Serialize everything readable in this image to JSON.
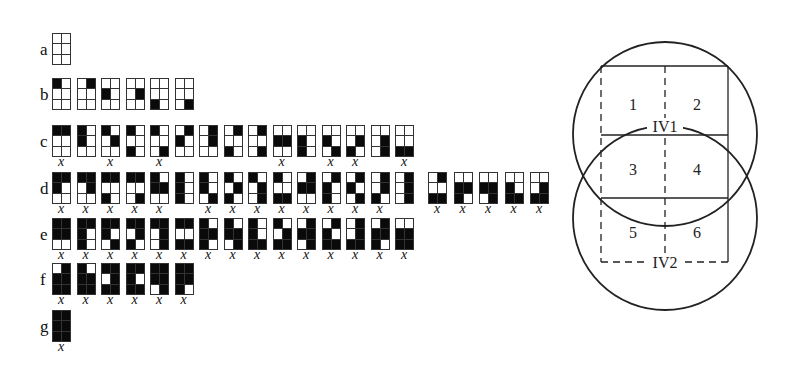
{
  "rows": [
    {
      "label": "a",
      "top": 33,
      "grids": [
        {
          "on": [],
          "x": false
        }
      ]
    },
    {
      "label": "b",
      "top": 78,
      "grids": [
        {
          "on": [
            1
          ],
          "x": false
        },
        {
          "on": [
            2
          ],
          "x": false
        },
        {
          "on": [
            3
          ],
          "x": false
        },
        {
          "on": [
            4
          ],
          "x": false
        },
        {
          "on": [
            5
          ],
          "x": false
        },
        {
          "on": [
            6
          ],
          "x": false
        }
      ]
    },
    {
      "label": "c",
      "top": 125,
      "grids": [
        {
          "on": [
            1,
            2
          ],
          "x": true
        },
        {
          "on": [
            1,
            3
          ],
          "x": false
        },
        {
          "on": [
            1,
            4
          ],
          "x": true
        },
        {
          "on": [
            1,
            5
          ],
          "x": false
        },
        {
          "on": [
            1,
            6
          ],
          "x": true
        },
        {
          "on": [
            2,
            3
          ],
          "x": false
        },
        {
          "on": [
            2,
            4
          ],
          "x": false
        },
        {
          "on": [
            2,
            5
          ],
          "x": false
        },
        {
          "on": [
            2,
            6
          ],
          "x": false
        },
        {
          "on": [
            3,
            4
          ],
          "x": true
        },
        {
          "on": [
            3,
            5
          ],
          "x": false
        },
        {
          "on": [
            3,
            6
          ],
          "x": true
        },
        {
          "on": [
            4,
            5
          ],
          "x": true
        },
        {
          "on": [
            4,
            6
          ],
          "x": false
        },
        {
          "on": [
            5,
            6
          ],
          "x": true
        }
      ]
    },
    {
      "label": "d",
      "top": 172,
      "grids": [
        {
          "on": [
            1,
            2,
            3
          ],
          "x": true
        },
        {
          "on": [
            1,
            2,
            4
          ],
          "x": true
        },
        {
          "on": [
            1,
            2,
            5
          ],
          "x": true
        },
        {
          "on": [
            1,
            2,
            6
          ],
          "x": true
        },
        {
          "on": [
            1,
            3,
            4
          ],
          "x": true
        },
        {
          "on": [
            1,
            3,
            5
          ],
          "x": false
        },
        {
          "on": [
            1,
            3,
            6
          ],
          "x": true
        },
        {
          "on": [
            1,
            4,
            5
          ],
          "x": true
        },
        {
          "on": [
            1,
            4,
            6
          ],
          "x": true
        },
        {
          "on": [
            1,
            5,
            6
          ],
          "x": true
        },
        {
          "on": [
            2,
            3,
            4
          ],
          "x": true
        },
        {
          "on": [
            2,
            3,
            5
          ],
          "x": true
        },
        {
          "on": [
            2,
            3,
            6
          ],
          "x": true
        },
        {
          "on": [
            2,
            4,
            5
          ],
          "x": true
        },
        {
          "on": [
            2,
            4,
            6
          ],
          "x": false
        },
        {
          "on": [
            2,
            5,
            6
          ],
          "x": true
        },
        {
          "on": [
            3,
            4,
            5
          ],
          "x": true
        },
        {
          "on": [
            3,
            4,
            6
          ],
          "x": true
        },
        {
          "on": [
            3,
            5,
            6
          ],
          "x": true
        },
        {
          "on": [
            4,
            5,
            6
          ],
          "x": true
        }
      ]
    },
    {
      "label": "e",
      "top": 218,
      "grids": [
        {
          "on": [
            1,
            2,
            3,
            4
          ],
          "x": true
        },
        {
          "on": [
            1,
            2,
            3,
            5
          ],
          "x": true
        },
        {
          "on": [
            1,
            2,
            3,
            6
          ],
          "x": true
        },
        {
          "on": [
            1,
            2,
            4,
            5
          ],
          "x": true
        },
        {
          "on": [
            1,
            2,
            4,
            6
          ],
          "x": true
        },
        {
          "on": [
            1,
            2,
            5,
            6
          ],
          "x": true
        },
        {
          "on": [
            1,
            3,
            4,
            5
          ],
          "x": true
        },
        {
          "on": [
            1,
            3,
            4,
            6
          ],
          "x": true
        },
        {
          "on": [
            1,
            3,
            5,
            6
          ],
          "x": true
        },
        {
          "on": [
            1,
            4,
            5,
            6
          ],
          "x": true
        },
        {
          "on": [
            2,
            3,
            4,
            6
          ],
          "x": true
        },
        {
          "on": [
            2,
            3,
            5,
            6
          ],
          "x": true
        },
        {
          "on": [
            2,
            4,
            5,
            6
          ],
          "x": true
        },
        {
          "on": [
            2,
            3,
            4,
            5
          ],
          "x": true
        },
        {
          "on": [
            3,
            4,
            5,
            6
          ],
          "x": true
        }
      ]
    },
    {
      "label": "f",
      "top": 263,
      "grids": [
        {
          "on": [
            2,
            3,
            4,
            5,
            6
          ],
          "x": true
        },
        {
          "on": [
            1,
            3,
            4,
            5,
            6
          ],
          "x": true
        },
        {
          "on": [
            1,
            2,
            4,
            5,
            6
          ],
          "x": true
        },
        {
          "on": [
            1,
            2,
            3,
            5,
            6
          ],
          "x": true
        },
        {
          "on": [
            1,
            2,
            3,
            4,
            6
          ],
          "x": true
        },
        {
          "on": [
            1,
            2,
            3,
            4,
            5
          ],
          "x": true
        }
      ]
    },
    {
      "label": "g",
      "top": 310,
      "grids": [
        {
          "on": [
            1,
            2,
            3,
            4,
            5,
            6
          ],
          "x": true
        }
      ]
    }
  ],
  "x_mark": "x",
  "venn": {
    "regions": [
      "1",
      "2",
      "3",
      "4",
      "5",
      "6"
    ],
    "set_labels": [
      "IV1",
      "IV2"
    ]
  }
}
